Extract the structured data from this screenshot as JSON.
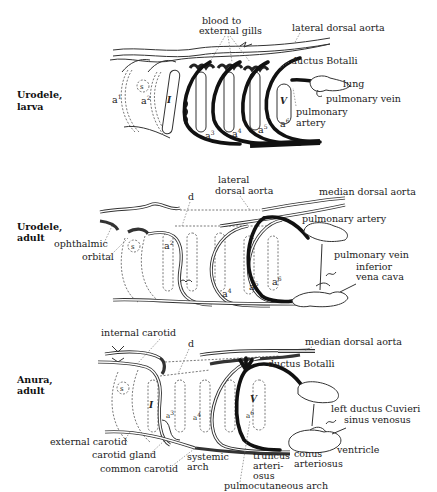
{
  "panels": [
    {
      "title_line1": "Urodele,",
      "title_line2": "larva",
      "labels": {
        "blood_to": "blood to",
        "external_gills": "external gills",
        "lateral_dorsal_aorta": "lateral dorsal aorta",
        "ductus_botalli": "ductus Botalli",
        "lung": "lung",
        "pulmonary_vein": "pulmonary vein",
        "pulmonary": "pulmonary",
        "artery": "artery",
        "s": "s",
        "a1": "a",
        "a2": "a",
        "a3": "a",
        "a4": "a",
        "a5": "a",
        "a6": "a",
        "roman_I": "I",
        "roman_V": "V"
      }
    },
    {
      "title_line1": "Urodele,",
      "title_line2": "adult",
      "labels": {
        "lateral": "lateral",
        "dorsal_aorta": "dorsal aorta",
        "median_dorsal_aorta": "median dorsal aorta",
        "d": "d",
        "pulmonary_artery": "pulmonary artery",
        "pulmonary_vein": "pulmonary vein",
        "inferior": "inferior",
        "vena_cava": "vena cava",
        "ophthalmic": "ophthalmic",
        "orbital": "orbital",
        "s": "s",
        "a2": "a",
        "a4": "a",
        "a5": "a",
        "a6": "a"
      }
    },
    {
      "title_line1": "Anura,",
      "title_line2": "adult",
      "labels": {
        "internal_carotid": "internal carotid",
        "median_dorsal_aorta": "median dorsal  aorta",
        "d": "d",
        "ductus_botalli": "ductus Botalli",
        "left_ductus_cuvieri": "left  ductus Cuvieri",
        "sinus_venosus": "sinus venosus",
        "ventricle": "ventricle",
        "conus": "conus",
        "arteriosus": "arteriosus",
        "truncus": "truncus",
        "arteri": "arteri-",
        "osus": "osus",
        "pulmocutaneous_arch": "pulmocutaneous arch",
        "systemic": "systemic",
        "arch": "arch",
        "external_carotid": "external carotid",
        "carotid_gland": "carotid gland",
        "common_carotid": "common carotid",
        "s": "s",
        "a3": "a",
        "a4": "a",
        "a6": "a",
        "roman_I": "I",
        "roman_V": "V"
      }
    }
  ],
  "superscripts": {
    "one": "1",
    "two": "2",
    "three": "3",
    "four": "4",
    "five": "5",
    "six": "6"
  }
}
